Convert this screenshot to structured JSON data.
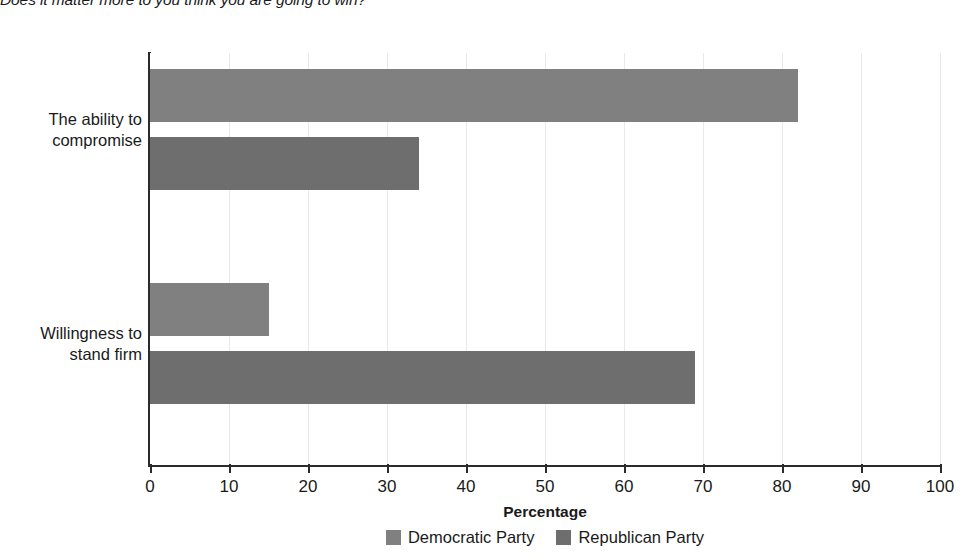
{
  "caption": {
    "text": "Does it matter more to you think you are going to win?",
    "visible_fragment": "u think you are going to win?"
  },
  "chart_data": {
    "type": "bar",
    "orientation": "horizontal",
    "title": "",
    "categories": [
      "The ability to compromise",
      "Willingness to stand firm"
    ],
    "category_lines": [
      [
        "The ability to",
        "compromise"
      ],
      [
        "Willingness to",
        "stand firm"
      ]
    ],
    "series": [
      {
        "name": "Democratic Party",
        "values": [
          82,
          15
        ],
        "color": "#808080"
      },
      {
        "name": "Republican Party",
        "values": [
          34,
          69
        ],
        "color": "#6e6e6e"
      }
    ],
    "xlabel": "Percentage",
    "ylabel": "",
    "xlim": [
      0,
      100
    ],
    "xticks": [
      0,
      10,
      20,
      30,
      40,
      50,
      60,
      70,
      80,
      90,
      100
    ],
    "xtick_labels": [
      "0",
      "10",
      "20",
      "30",
      "40",
      "50",
      "60",
      "70",
      "80",
      "90",
      "100"
    ],
    "grid": "vertical",
    "legend_position": "bottom"
  },
  "legend": {
    "items": [
      {
        "label": "Democratic Party",
        "color": "#808080"
      },
      {
        "label": "Republican Party",
        "color": "#6e6e6e"
      }
    ]
  },
  "axis": {
    "x_title": "Percentage"
  }
}
